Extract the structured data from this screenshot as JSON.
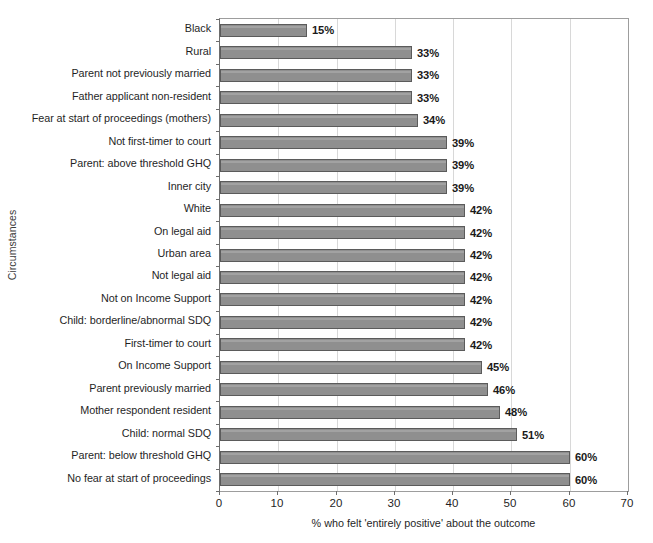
{
  "chart_data": {
    "type": "bar",
    "orientation": "horizontal",
    "title": "",
    "xlabel": "% who felt 'entirely positive' about the outcome",
    "ylabel": "Circumstances",
    "xlim": [
      0,
      70
    ],
    "xticks": [
      0,
      10,
      20,
      30,
      40,
      50,
      60,
      70
    ],
    "grid": "vertical",
    "legend": "none",
    "value_suffix": "%",
    "bar_color": "#8f8f8f",
    "bar_border_color": "#5b5b5b",
    "gridline_color": "#d8d8d8",
    "axis_color": "#6d6d6d",
    "categories": [
      "Black",
      "Rural",
      "Parent not previously married",
      "Father applicant non-resident",
      "Fear at start of proceedings (mothers)",
      "Not first-timer to court",
      "Parent: above threshold GHQ",
      "Inner city",
      "White",
      "On legal aid",
      "Urban area",
      "Not legal aid",
      "Not on Income Support",
      "Child: borderline/abnormal SDQ",
      "First-timer to court",
      "On Income Support",
      "Parent previously married",
      "Mother respondent resident",
      "Child: normal SDQ",
      "Parent: below threshold GHQ",
      "No fear at start of proceedings"
    ],
    "values": [
      15,
      33,
      33,
      33,
      34,
      39,
      39,
      39,
      42,
      42,
      42,
      42,
      42,
      42,
      42,
      45,
      46,
      48,
      51,
      60,
      60
    ],
    "value_labels": [
      "15%",
      "33%",
      "33%",
      "33%",
      "34%",
      "39%",
      "39%",
      "39%",
      "42%",
      "42%",
      "42%",
      "42%",
      "42%",
      "42%",
      "42%",
      "45%",
      "46%",
      "48%",
      "51%",
      "60%",
      "60%"
    ],
    "xtick_labels": [
      "0",
      "10",
      "20",
      "30",
      "40",
      "50",
      "60",
      "70"
    ]
  }
}
